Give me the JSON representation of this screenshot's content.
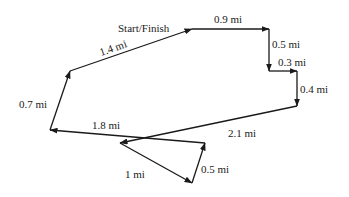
{
  "diagram": {
    "type": "route-map",
    "start_label": "Start/Finish",
    "line_color": "#1a1a1a",
    "segments": [
      {
        "label": "0.9 mi",
        "from": [
          192,
          29
        ],
        "to": [
          269,
          29
        ]
      },
      {
        "label": "0.5 mi",
        "from": [
          269,
          29
        ],
        "to": [
          269,
          71
        ]
      },
      {
        "label": "0.3 mi",
        "from": [
          269,
          71
        ],
        "to": [
          297,
          71
        ]
      },
      {
        "label": "0.4 mi",
        "from": [
          297,
          71
        ],
        "to": [
          297,
          106
        ]
      },
      {
        "label": "2.1 mi",
        "from": [
          297,
          106
        ],
        "to": [
          120,
          143
        ]
      },
      {
        "label": "1 mi",
        "from": [
          120,
          143
        ],
        "to": [
          192,
          183
        ]
      },
      {
        "label": "0.5 mi",
        "from": [
          192,
          183
        ],
        "to": [
          205,
          143
        ]
      },
      {
        "label": "1.8 mi",
        "from": [
          205,
          143
        ],
        "to": [
          50,
          130
        ]
      },
      {
        "label": "0.7 mi",
        "from": [
          50,
          130
        ],
        "to": [
          70,
          71
        ]
      },
      {
        "label": "1.4 mi",
        "from": [
          70,
          71
        ],
        "to": [
          192,
          29
        ]
      }
    ]
  },
  "labels": {
    "start": "Start/Finish",
    "s1": "0.9 mi",
    "s2": "0.5 mi",
    "s3": "0.3 mi",
    "s4": "0.4 mi",
    "s5": "2.1 mi",
    "s6": "1 mi",
    "s7": "0.5 mi",
    "s8": "1.8 mi",
    "s9": "0.7 mi",
    "s10": "1.4 mi"
  }
}
